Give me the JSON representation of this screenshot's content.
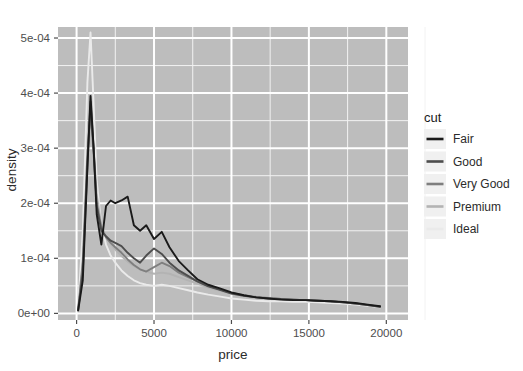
{
  "top_fragment": "ggplot density by cut",
  "panel": {
    "bg_color": "#bdbdbd",
    "grid_major_color": "#ffffff",
    "grid_minor_color": "#f2f2f2"
  },
  "axes": {
    "x": {
      "label": "price",
      "ticks": [
        0,
        5000,
        10000,
        15000,
        20000
      ],
      "tick_labels": [
        "0",
        "5000",
        "10000",
        "15000",
        "20000"
      ],
      "range": [
        -1200,
        21400
      ]
    },
    "y": {
      "label": "density",
      "ticks": [
        0,
        0.0001,
        0.0002,
        0.0003,
        0.0004,
        0.0005
      ],
      "tick_labels": [
        "0e+00",
        "1e-04",
        "2e-04",
        "3e-04",
        "4e-04",
        "5e-04"
      ],
      "range": [
        -1.2e-05,
        0.00052
      ]
    }
  },
  "legend": {
    "title": "cut",
    "position": "right",
    "key_bg": "#f0f0f0",
    "items": [
      {
        "label": "Fair",
        "color": "#1a1a1a"
      },
      {
        "label": "Good",
        "color": "#4d4d4d"
      },
      {
        "label": "Very Good",
        "color": "#7f7f7f"
      },
      {
        "label": "Premium",
        "color": "#b3b3b3"
      },
      {
        "label": "Ideal",
        "color": "#eaeaea"
      }
    ]
  },
  "chart_data": {
    "type": "line",
    "title": "",
    "subtitle": "",
    "xlabel": "price",
    "ylabel": "density",
    "xlim": [
      -1200,
      21400
    ],
    "ylim": [
      -1.2e-05,
      0.00052
    ],
    "grid": true,
    "legend_position": "right",
    "legend_title": "cut",
    "x": [
      100,
      400,
      700,
      900,
      1100,
      1300,
      1600,
      1900,
      2200,
      2500,
      2900,
      3300,
      3700,
      4100,
      4500,
      5000,
      5500,
      6000,
      6600,
      7200,
      7800,
      8500,
      9200,
      10000,
      10800,
      11600,
      12400,
      13200,
      14000,
      14800,
      15600,
      16400,
      17200,
      18000,
      18800,
      19600
    ],
    "series": [
      {
        "name": "Fair",
        "color": "#1a1a1a",
        "values": [
          5e-06,
          6e-05,
          0.000265,
          0.000395,
          0.0003,
          0.00018,
          0.000125,
          0.000195,
          0.000205,
          0.0002,
          0.000205,
          0.000212,
          0.00016,
          0.00015,
          0.00016,
          0.000135,
          0.000148,
          0.00012,
          9.5e-05,
          7.8e-05,
          6.2e-05,
          5.2e-05,
          4.6e-05,
          3.8e-05,
          3.3e-05,
          2.9e-05,
          2.7e-05,
          2.5e-05,
          2.4e-05,
          2.4e-05,
          2.3e-05,
          2.2e-05,
          2.1e-05,
          1.9e-05,
          1.6e-05,
          1.3e-05
        ]
      },
      {
        "name": "Good",
        "color": "#4d4d4d",
        "values": [
          6e-06,
          7.5e-05,
          0.00027,
          0.000385,
          0.0003,
          0.000195,
          0.00015,
          0.00014,
          0.000132,
          0.000128,
          0.000122,
          0.00011,
          0.0001,
          9.2e-05,
          0.000105,
          0.000118,
          0.000108,
          9.2e-05,
          7.8e-05,
          6.8e-05,
          5.8e-05,
          4.9e-05,
          4.3e-05,
          3.6e-05,
          3.2e-05,
          2.9e-05,
          2.7e-05,
          2.6e-05,
          2.5e-05,
          2.4e-05,
          2.3e-05,
          2.2e-05,
          2e-05,
          1.8e-05,
          1.5e-05,
          1.2e-05
        ]
      },
      {
        "name": "Very Good",
        "color": "#7f7f7f",
        "values": [
          7e-06,
          9.5e-05,
          0.00029,
          0.00037,
          0.00029,
          0.0002,
          0.000155,
          0.000138,
          0.000128,
          0.00012,
          0.00011,
          9.8e-05,
          8.8e-05,
          8e-05,
          7.6e-05,
          8.4e-05,
          9.2e-05,
          8.6e-05,
          7.4e-05,
          6.6e-05,
          5.8e-05,
          5e-05,
          4.4e-05,
          3.7e-05,
          3.3e-05,
          3e-05,
          2.8e-05,
          2.6e-05,
          2.5e-05,
          2.4e-05,
          2.3e-05,
          2.2e-05,
          2e-05,
          1.8e-05,
          1.5e-05,
          1.2e-05
        ]
      },
      {
        "name": "Premium",
        "color": "#b3b3b3",
        "values": [
          6e-06,
          8.5e-05,
          0.000275,
          0.00036,
          0.0003,
          0.000215,
          0.00016,
          0.00014,
          0.000126,
          0.000116,
          0.000104,
          9.4e-05,
          8.6e-05,
          8e-05,
          7.6e-05,
          7.2e-05,
          7.4e-05,
          7.2e-05,
          6.6e-05,
          6e-05,
          5.4e-05,
          4.7e-05,
          4.2e-05,
          3.6e-05,
          3.2e-05,
          2.9e-05,
          2.7e-05,
          2.6e-05,
          2.5e-05,
          2.4e-05,
          2.3e-05,
          2.2e-05,
          2e-05,
          1.8e-05,
          1.5e-05,
          1.2e-05
        ]
      },
      {
        "name": "Ideal",
        "color": "#eaeaea",
        "values": [
          1e-05,
          0.00015,
          0.00042,
          0.00051,
          0.00038,
          0.00024,
          0.00016,
          0.000125,
          0.000105,
          9.2e-05,
          7.8e-05,
          6.8e-05,
          6e-05,
          5.5e-05,
          5.2e-05,
          5e-05,
          5.2e-05,
          5e-05,
          4.6e-05,
          4.2e-05,
          3.8e-05,
          3.4e-05,
          3.1e-05,
          2.7e-05,
          2.5e-05,
          2.3e-05,
          2.2e-05,
          2.2e-05,
          2.1e-05,
          2.1e-05,
          2e-05,
          1.9e-05,
          1.8e-05,
          1.6e-05,
          1.4e-05,
          1.1e-05
        ]
      }
    ]
  }
}
